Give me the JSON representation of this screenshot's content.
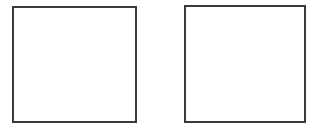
{
  "diagram": {
    "shapes": [
      {
        "type": "square",
        "position": "left",
        "fill": "#ffffff",
        "stroke": "#3a3a3a"
      },
      {
        "type": "square",
        "position": "right",
        "fill": "#ffffff",
        "stroke": "#3a3a3a"
      }
    ]
  }
}
